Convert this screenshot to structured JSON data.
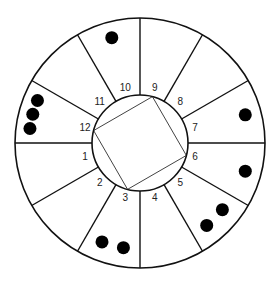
{
  "diagram": {
    "center": [
      140,
      143
    ],
    "outer_radius": 125,
    "inner_radius": 48,
    "stroke_color": "#111111",
    "dot_color": "#000000",
    "square_rotation_deg": 15,
    "segments": [
      {
        "label": "9",
        "mid_angle": 15,
        "dots": 0
      },
      {
        "label": "8",
        "mid_angle": 45,
        "dots": 0
      },
      {
        "label": "7",
        "mid_angle": 75,
        "dots": 1
      },
      {
        "label": "6",
        "mid_angle": 105,
        "dots": 1
      },
      {
        "label": "5",
        "mid_angle": 135,
        "dots": 2
      },
      {
        "label": "4",
        "mid_angle": 165,
        "dots": 0
      },
      {
        "label": "3",
        "mid_angle": 195,
        "dots": 2
      },
      {
        "label": "2",
        "mid_angle": 225,
        "dots": 0
      },
      {
        "label": "1",
        "mid_angle": 255,
        "dots": 0
      },
      {
        "label": "12",
        "mid_angle": 285,
        "dots": 3
      },
      {
        "label": "11",
        "mid_angle": 315,
        "dots": 0
      },
      {
        "label": "10",
        "mid_angle": 345,
        "dots": 1
      }
    ]
  }
}
